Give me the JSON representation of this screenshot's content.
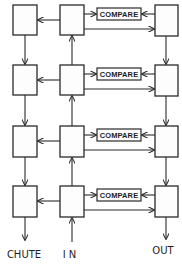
{
  "diagram": {
    "type": "block-diagram",
    "rows": 4,
    "columns": [
      "chute-column",
      "in-column",
      "out-column"
    ],
    "compare_label": "COMPARE",
    "stages": [
      {
        "compare_label": "COMPARE"
      },
      {
        "compare_label": "COMPARE"
      },
      {
        "compare_label": "COMPARE"
      },
      {
        "compare_label": "COMPARE"
      }
    ],
    "labels": {
      "chute": "CHUTE",
      "in": "IN",
      "out": "OUT"
    },
    "colors": {
      "stroke": "#2a2a2a",
      "background": "#ffffff"
    }
  }
}
